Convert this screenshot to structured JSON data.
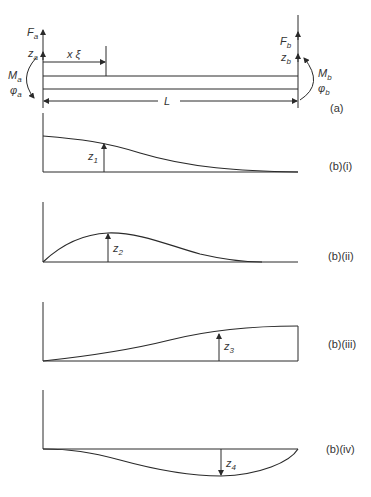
{
  "figure": {
    "panel_a": {
      "tag": "(a)",
      "left_end": {
        "force": "F",
        "force_sub": "a",
        "disp": "z",
        "disp_sub": "a",
        "moment": "M",
        "moment_sub": "a",
        "rotation": "φ",
        "rotation_sub": "a"
      },
      "right_end": {
        "force": "F",
        "force_sub": "b",
        "disp": "z",
        "disp_sub": "b",
        "moment": "M",
        "moment_sub": "b",
        "rotation": "φ",
        "rotation_sub": "b"
      },
      "position_label": "x ξ",
      "length_label": "L"
    },
    "panels_b": [
      {
        "tag": "(b)(i)",
        "label": "z",
        "sub": "1"
      },
      {
        "tag": "(b)(ii)",
        "label": "z",
        "sub": "2"
      },
      {
        "tag": "(b)(iii)",
        "label": "z",
        "sub": "3"
      },
      {
        "tag": "(b)(iv)",
        "label": "z",
        "sub": "4"
      }
    ]
  }
}
